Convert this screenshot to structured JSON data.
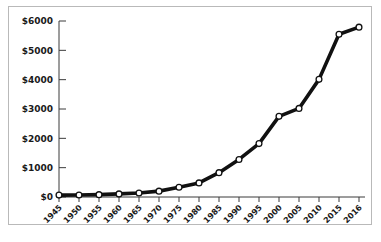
{
  "chart_data": {
    "type": "line",
    "title": "",
    "xlabel": "",
    "ylabel": "",
    "categories": [
      "1945",
      "1950",
      "1955",
      "1960",
      "1965",
      "1970",
      "1975",
      "1980",
      "1985",
      "1990",
      "1995",
      "2000",
      "2005",
      "2010",
      "2015",
      "2016"
    ],
    "values": [
      65,
      70,
      80,
      105,
      135,
      200,
      330,
      480,
      830,
      1280,
      1820,
      2750,
      3020,
      4010,
      5550,
      5790
    ],
    "ylim": [
      0,
      6000
    ],
    "ytick_values": [
      0,
      1000,
      2000,
      3000,
      4000,
      5000,
      6000
    ],
    "ytick_labels": [
      "$0",
      "$1000",
      "$2000",
      "$3000",
      "$4000",
      "$5000",
      "$6000"
    ],
    "xtick_labels": [
      "1945",
      "1950",
      "1955",
      "1960",
      "1965",
      "1970",
      "1975",
      "1980",
      "1985",
      "1990",
      "1995",
      "2000",
      "2005",
      "2010",
      "2015",
      "2016"
    ],
    "grid": false,
    "legend": false,
    "marker": "open-circle",
    "line_color": "#111111",
    "marker_fill": "#ffffff",
    "axis_color": "#3b3b3b",
    "frame_color": "#b9b9b9",
    "background": "#ffffff"
  },
  "caption": {
    "text": ""
  }
}
